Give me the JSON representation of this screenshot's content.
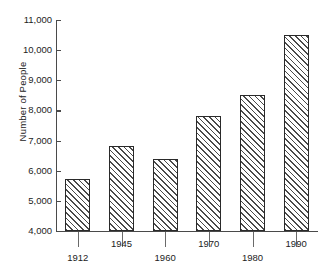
{
  "chart_data": {
    "type": "bar",
    "title": "",
    "subtitle": "",
    "xlabel": "",
    "ylabel": "Number of People",
    "categories": [
      "1912",
      "1945",
      "1960",
      "1970",
      "1980",
      "1990"
    ],
    "values": [
      5730,
      6830,
      6400,
      7820,
      8500,
      10500
    ],
    "ylim": [
      4000,
      11000
    ],
    "ytick_values": [
      4000,
      5000,
      6000,
      7000,
      8000,
      9000,
      10000,
      11000
    ],
    "ytick_labels": [
      "4,000",
      "5,000",
      "6,000",
      "7,000",
      "8,000",
      "9,000",
      "10,000",
      "11,000"
    ],
    "grid": false,
    "legend": false,
    "legend_position": "none",
    "bar_fill": "diagonal-hatch",
    "bar_edge_color": "#2a2a2a",
    "hatch_color": "#4a4a4a",
    "background_color": "#ffffff",
    "axis_color": "#4a4a4a",
    "xtick_label_stagger": true,
    "series": [
      {
        "name": "Number of People",
        "values": [
          5730,
          6830,
          6400,
          7820,
          8500,
          10500
        ]
      }
    ],
    "points": [
      {
        "category": "1912",
        "value": 5730
      },
      {
        "category": "1945",
        "value": 6830
      },
      {
        "category": "1960",
        "value": 6400
      },
      {
        "category": "1970",
        "value": 7820
      },
      {
        "category": "1980",
        "value": 8500
      },
      {
        "category": "1990",
        "value": 10500
      }
    ]
  }
}
